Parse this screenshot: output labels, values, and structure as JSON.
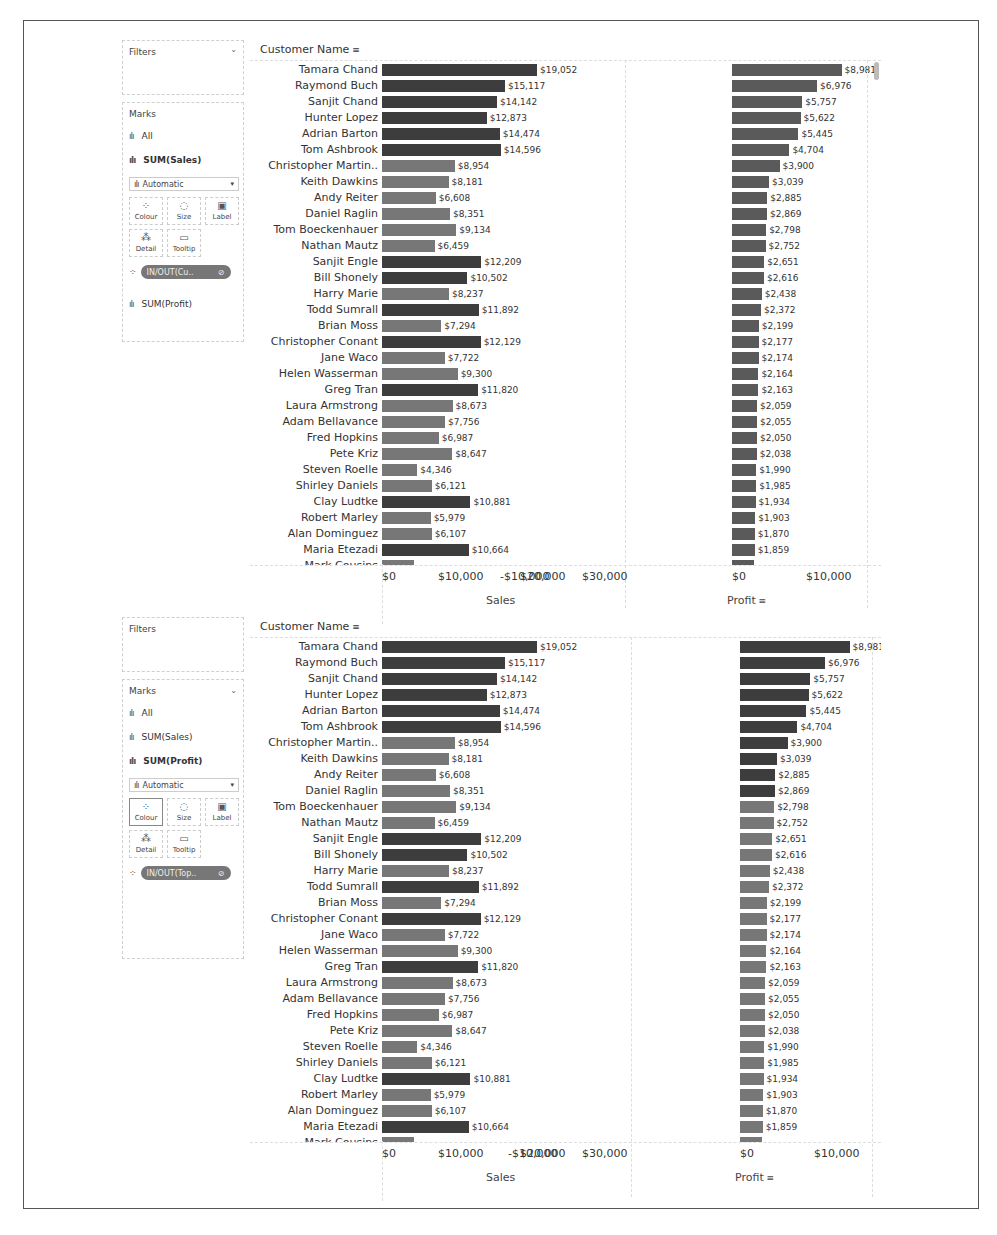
{
  "colors": {
    "in_dark": "#3d3d3d",
    "out_light": "#777777",
    "profit_uniform": "#5a5a5a"
  },
  "panels": [
    {
      "filters_title": "Filters",
      "marks_title": "Marks",
      "marks_all": "All",
      "marks_sales": "SUM(Sales)",
      "marks_profit": "SUM(Profit)",
      "active_mark": "SUM(Sales)",
      "mark_type": "Automatic",
      "cards": [
        "Colour",
        "Size",
        "Label",
        "Detail",
        "Tooltip"
      ],
      "colour_pill": "IN/OUT(Cu..",
      "header": "Customer Name",
      "sales_axis_title": "Sales",
      "profit_axis_title": "Profit"
    },
    {
      "filters_title": "Filters",
      "marks_title": "Marks",
      "marks_all": "All",
      "marks_sales": "SUM(Sales)",
      "marks_profit": "SUM(Profit)",
      "active_mark": "SUM(Profit)",
      "mark_type": "Automatic",
      "cards": [
        "Colour",
        "Size",
        "Label",
        "Detail",
        "Tooltip"
      ],
      "colour_pill": "IN/OUT(Top..",
      "header": "Customer Name",
      "sales_axis_title": "Sales",
      "profit_axis_title": "Profit"
    }
  ],
  "axes": {
    "sales_ticks": [
      "$0",
      "$10,000",
      "$20,000",
      "$30,000"
    ],
    "profit_ticks": [
      "-$10,000",
      "$0",
      "$10,000"
    ]
  },
  "chart_data": [
    {
      "type": "bar",
      "title": "Customer Name — Sales & Profit (colour: IN/OUT of Customer set by Sales)",
      "orientation": "horizontal",
      "categories": [
        "Tamara Chand",
        "Raymond Buch",
        "Sanjit Chand",
        "Hunter Lopez",
        "Adrian Barton",
        "Tom Ashbrook",
        "Christopher Martin..",
        "Keith Dawkins",
        "Andy Reiter",
        "Daniel Raglin",
        "Tom Boeckenhauer",
        "Nathan Mautz",
        "Sanjit Engle",
        "Bill Shonely",
        "Harry Marie",
        "Todd Sumrall",
        "Brian Moss",
        "Christopher Conant",
        "Jane Waco",
        "Helen Wasserman",
        "Greg Tran",
        "Laura Armstrong",
        "Adam Bellavance",
        "Fred Hopkins",
        "Pete Kriz",
        "Steven Roelle",
        "Shirley Daniels",
        "Clay Ludtke",
        "Robert Marley",
        "Alan Dominguez",
        "Maria Etezadi"
      ],
      "series": [
        {
          "name": "Sales",
          "values": [
            19052,
            15117,
            14142,
            12873,
            14474,
            14596,
            8954,
            8181,
            6608,
            8351,
            9134,
            6459,
            12209,
            10502,
            8237,
            11892,
            7294,
            12129,
            7722,
            9300,
            11820,
            8673,
            7756,
            6987,
            8647,
            4346,
            6121,
            10881,
            5979,
            6107,
            10664
          ],
          "labels": [
            "$19,052",
            "$15,117",
            "$14,142",
            "$12,873",
            "$14,474",
            "$14,596",
            "$8,954",
            "$8,181",
            "$6,608",
            "$8,351",
            "$9,134",
            "$6,459",
            "$12,209",
            "$10,502",
            "$8,237",
            "$11,892",
            "$7,294",
            "$12,129",
            "$7,722",
            "$9,300",
            "$11,820",
            "$8,673",
            "$7,756",
            "$6,987",
            "$8,647",
            "$4,346",
            "$6,121",
            "$10,881",
            "$5,979",
            "$6,107",
            "$10,664"
          ],
          "in_set": [
            true,
            true,
            true,
            true,
            true,
            true,
            false,
            false,
            false,
            false,
            false,
            false,
            true,
            true,
            false,
            true,
            false,
            true,
            false,
            false,
            true,
            false,
            false,
            false,
            false,
            false,
            false,
            true,
            false,
            false,
            true
          ]
        },
        {
          "name": "Profit",
          "values": [
            8981,
            6976,
            5757,
            5622,
            5445,
            4704,
            3900,
            3039,
            2885,
            2869,
            2798,
            2752,
            2651,
            2616,
            2438,
            2372,
            2199,
            2177,
            2174,
            2164,
            2163,
            2059,
            2055,
            2050,
            2038,
            1990,
            1985,
            1934,
            1903,
            1870,
            1859
          ],
          "labels": [
            "$8,981",
            "$6,976",
            "$5,757",
            "$5,622",
            "$5,445",
            "$4,704",
            "$3,900",
            "$3,039",
            "$2,885",
            "$2,869",
            "$2,798",
            "$2,752",
            "$2,651",
            "$2,616",
            "$2,438",
            "$2,372",
            "$2,199",
            "$2,177",
            "$2,174",
            "$2,164",
            "$2,163",
            "$2,059",
            "$2,055",
            "$2,050",
            "$2,038",
            "$1,990",
            "$1,985",
            "$1,934",
            "$1,903",
            "$1,870",
            "$1,859"
          ]
        }
      ],
      "xlabel": [
        "Sales",
        "Profit"
      ],
      "ylabel": "Customer Name",
      "sales_range": [
        0,
        30000
      ],
      "profit_range": [
        -10000,
        10000
      ],
      "grid": false
    },
    {
      "type": "bar",
      "title": "Customer Name — Sales & Profit (profit colour: IN/OUT of Top set)",
      "orientation": "horizontal",
      "categories": "same as chart 1",
      "profit_in_set": [
        true,
        true,
        true,
        true,
        true,
        true,
        true,
        true,
        true,
        true,
        false,
        false,
        false,
        false,
        false,
        false,
        false,
        false,
        false,
        false,
        false,
        false,
        false,
        false,
        false,
        false,
        false,
        false,
        false,
        false,
        false
      ],
      "xlabel": [
        "Sales",
        "Profit"
      ],
      "sales_range": [
        0,
        30000
      ],
      "profit_range": [
        -10000,
        10000
      ]
    }
  ],
  "truncated_last_row": "Mark Cousins"
}
